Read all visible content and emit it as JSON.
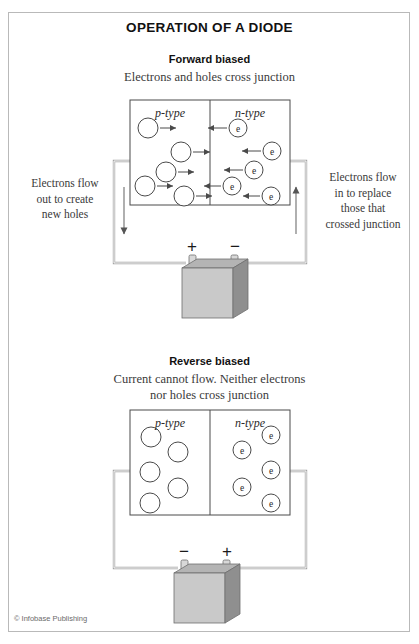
{
  "title": "OPERATION OF A DIODE",
  "credit": "© Infobase Publishing",
  "sections": {
    "forward": {
      "heading": "Forward biased",
      "subheading": "Electrons and holes cross junction",
      "p_label": "p-type",
      "n_label": "n-type",
      "note_left": "Electrons flow\nout to create\nnew holes",
      "note_right": "Electrons flow\nin to replace\nthose that\ncrossed junction",
      "battery_left_sign": "+",
      "battery_right_sign": "−",
      "left_wire_arrow": "down",
      "right_wire_arrow": "up",
      "electron_glyph": "e"
    },
    "reverse": {
      "heading": "Reverse biased",
      "subheading": "Current cannot flow. Neither electrons\nnor holes cross junction",
      "p_label": "p-type",
      "n_label": "n-type",
      "battery_left_sign": "−",
      "battery_right_sign": "+",
      "electron_glyph": "e"
    }
  },
  "colors": {
    "frame_border": "#b9b9b9",
    "diagram_stroke": "#4a4a4a",
    "wire_stroke": "#9a9a9a",
    "battery_front": "#c9c9c9",
    "battery_top": "#b0b0b0",
    "battery_side": "#8f8f8f",
    "terminal": "#d4d4d4",
    "text": "#1a1a1a"
  },
  "diagram_data": {
    "type": "diagram",
    "forward_biased": {
      "box": {
        "x": 130,
        "y": 100,
        "w": 160,
        "h": 105,
        "junction_x": 210
      },
      "holes": [
        {
          "cx": 148,
          "cy": 128,
          "r": 10,
          "arrow_to": 178
        },
        {
          "cx": 181,
          "cy": 152,
          "r": 10,
          "arrow_to": 212
        },
        {
          "cx": 166,
          "cy": 172,
          "r": 10,
          "arrow_to": 196
        },
        {
          "cx": 145,
          "cy": 186,
          "r": 10,
          "arrow_to": 175
        },
        {
          "cx": 184,
          "cy": 196,
          "r": 10,
          "arrow_to": 214
        }
      ],
      "electrons": [
        {
          "cx": 238,
          "cy": 128,
          "r": 9,
          "arrow_to": 206
        },
        {
          "cx": 272,
          "cy": 151,
          "r": 9,
          "arrow_to": 240
        },
        {
          "cx": 254,
          "cy": 170,
          "r": 9,
          "arrow_to": 222
        },
        {
          "cx": 232,
          "cy": 186,
          "r": 9,
          "arrow_to": 202
        },
        {
          "cx": 271,
          "cy": 196,
          "r": 9,
          "arrow_to": 241
        }
      ],
      "circuit": {
        "left_x": 114,
        "right_x": 306,
        "top_y": 161,
        "bottom_y": 263
      }
    },
    "reverse_biased": {
      "box": {
        "x": 130,
        "y": 410,
        "w": 160,
        "h": 105,
        "junction_x": 210
      },
      "holes": [
        {
          "cx": 151,
          "cy": 437,
          "r": 10
        },
        {
          "cx": 178,
          "cy": 452,
          "r": 10
        },
        {
          "cx": 150,
          "cy": 472,
          "r": 10
        },
        {
          "cx": 178,
          "cy": 488,
          "r": 10
        },
        {
          "cx": 150,
          "cy": 503,
          "r": 10
        }
      ],
      "electrons": [
        {
          "cx": 271,
          "cy": 435,
          "r": 9
        },
        {
          "cx": 242,
          "cy": 450,
          "r": 9
        },
        {
          "cx": 271,
          "cy": 470,
          "r": 9
        },
        {
          "cx": 242,
          "cy": 487,
          "r": 9
        },
        {
          "cx": 271,
          "cy": 503,
          "r": 9
        }
      ],
      "circuit": {
        "left_x": 114,
        "right_x": 306,
        "top_y": 471,
        "bottom_y": 568
      }
    }
  }
}
